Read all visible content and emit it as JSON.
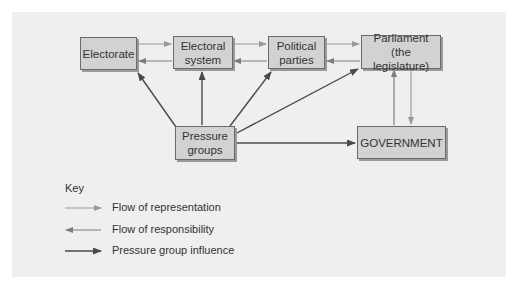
{
  "diagram": {
    "nodes": {
      "electorate": "Electorate",
      "electoral_system": "Electoral\nsystem",
      "political_parties": "Political\nparties",
      "parliament": "Parliament\n(the legislature)",
      "pressure_groups": "Pressure\ngroups",
      "government": "GOVERNMENT"
    },
    "edges": [
      {
        "from": "Electorate",
        "to": "Electoral system",
        "type": "representation"
      },
      {
        "from": "Electoral system",
        "to": "Political parties",
        "type": "representation"
      },
      {
        "from": "Political parties",
        "to": "Parliament",
        "type": "representation"
      },
      {
        "from": "Parliament",
        "to": "GOVERNMENT",
        "type": "representation"
      },
      {
        "from": "GOVERNMENT",
        "to": "Parliament",
        "type": "responsibility"
      },
      {
        "from": "Parliament",
        "to": "Political parties",
        "type": "responsibility"
      },
      {
        "from": "Political parties",
        "to": "Electoral system",
        "type": "responsibility"
      },
      {
        "from": "Electoral system",
        "to": "Electorate",
        "type": "responsibility"
      },
      {
        "from": "Pressure groups",
        "to": "Electorate",
        "type": "influence"
      },
      {
        "from": "Pressure groups",
        "to": "Electoral system",
        "type": "influence"
      },
      {
        "from": "Pressure groups",
        "to": "Political parties",
        "type": "influence"
      },
      {
        "from": "Pressure groups",
        "to": "Parliament",
        "type": "influence"
      },
      {
        "from": "Pressure groups",
        "to": "GOVERNMENT",
        "type": "influence"
      }
    ],
    "colors": {
      "panel": "#efefef",
      "box_fill": "#d2d2d2",
      "representation": "#9a9a9a",
      "responsibility": "#7d7d7d",
      "influence": "#4a4a4a"
    }
  },
  "key": {
    "title": "Key",
    "items": [
      {
        "label": "Flow of representation"
      },
      {
        "label": "Flow of responsibility"
      },
      {
        "label": "Pressure group influence"
      }
    ]
  }
}
